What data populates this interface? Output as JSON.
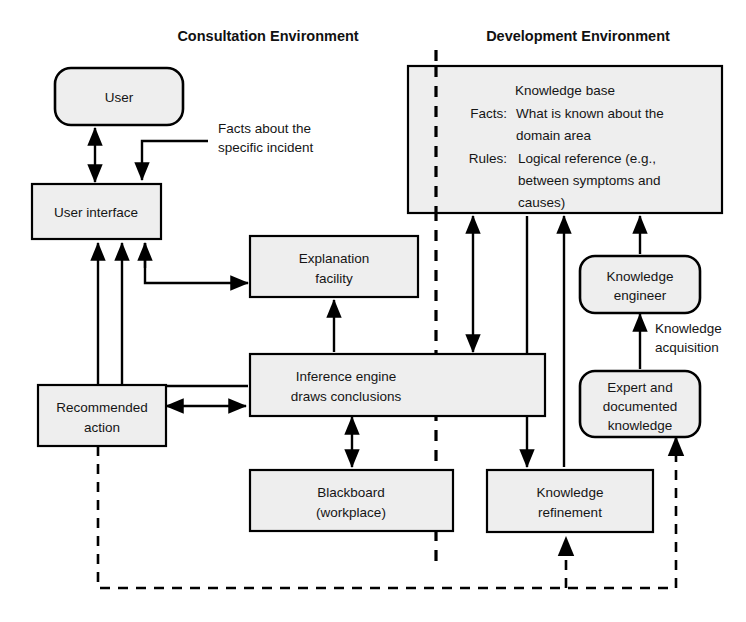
{
  "figure": {
    "kind": "expert-system-architecture-diagram",
    "background": "#ffffff",
    "line_color": "#000000",
    "node_fill": "#eeeeee"
  },
  "titles": {
    "left": "Consultation Environment",
    "right": "Development Environment"
  },
  "nodes": {
    "user": {
      "label": "User",
      "shape": "rounded"
    },
    "user_interface": {
      "label": "User interface",
      "shape": "rect"
    },
    "explanation_facility": {
      "line1": "Explanation",
      "line2": "facility",
      "shape": "rect"
    },
    "inference_engine": {
      "line1": "Inference engine",
      "line2": "draws conclusions",
      "shape": "rect"
    },
    "recommended_action": {
      "line1": "Recommended",
      "line2": "action",
      "shape": "rect"
    },
    "blackboard": {
      "line1": "Blackboard",
      "line2": "(workplace)",
      "shape": "rect"
    },
    "knowledge_refinement": {
      "line1": "Knowledge",
      "line2": "refinement",
      "shape": "rect"
    },
    "knowledge_engineer": {
      "line1": "Knowledge",
      "line2": "engineer",
      "shape": "rounded"
    },
    "expert_documented_knowledge": {
      "line1": "Expert and",
      "line2": "documented",
      "line3": "knowledge",
      "shape": "rounded"
    },
    "knowledge_base": {
      "title": "Knowledge base",
      "rows": [
        {
          "key": "Facts:",
          "line1": "What is known about the",
          "line2": "domain area"
        },
        {
          "key": "Rules:",
          "line1": "Logical reference (e.g.,",
          "line2": "between symptoms and",
          "line3": "causes)"
        }
      ]
    }
  },
  "annotations": {
    "facts_about_incident": {
      "line1": "Facts about the",
      "line2": "specific incident"
    },
    "knowledge_acquisition": {
      "line1": "Knowledge",
      "line2": "acquisition"
    }
  }
}
